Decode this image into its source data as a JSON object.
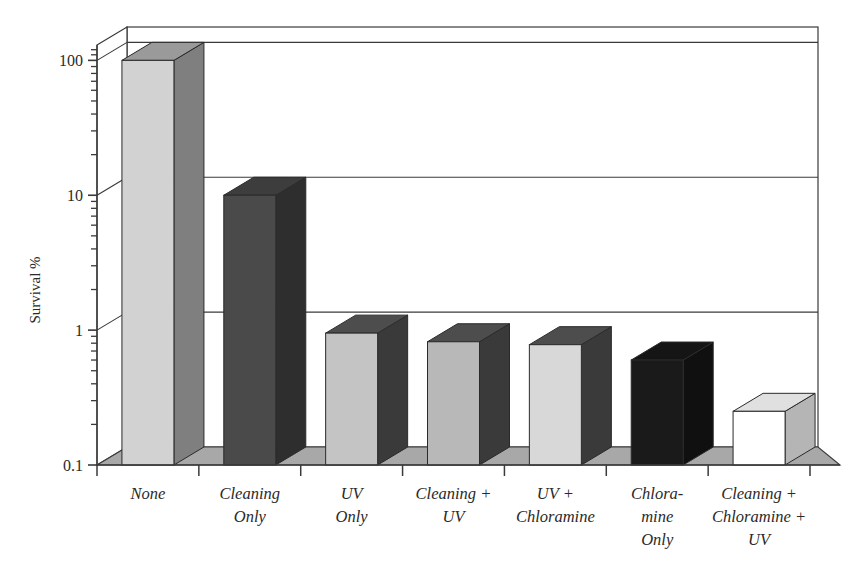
{
  "chart_data": {
    "type": "bar",
    "title": "",
    "subtitle": "",
    "xlabel": "",
    "ylabel": "Survival %",
    "yscale": "log",
    "ylim": [
      0.1,
      130
    ],
    "grid": true,
    "legend": "none",
    "style": "3d-bar",
    "categories": [
      "None",
      "Cleaning Only",
      "UV Only",
      "Cleaning + UV",
      "UV + Chloramine",
      "Chlora-mine Only",
      "Cleaning + Chloramine + UV"
    ],
    "category_lines": [
      [
        "None"
      ],
      [
        "Cleaning",
        "Only"
      ],
      [
        "UV",
        "Only"
      ],
      [
        "Cleaning +",
        "UV"
      ],
      [
        "UV +",
        "Chloramine"
      ],
      [
        "Chlora-",
        "mine",
        "Only"
      ],
      [
        "Cleaning +",
        "Chloramine +",
        "UV"
      ]
    ],
    "values": [
      100,
      10,
      0.95,
      0.82,
      0.78,
      0.6,
      0.25
    ],
    "ytick_labels": [
      "0.1",
      "1",
      "10",
      "100"
    ],
    "ytick_values": [
      0.1,
      1,
      10,
      100
    ],
    "gridline_values": [
      1,
      10,
      100
    ],
    "bar_colors_front": [
      "#d2d2d2",
      "#4a4a4a",
      "#c4c4c4",
      "#b8b8b8",
      "#d8d8d8",
      "#1a1a1a",
      "#ffffff"
    ],
    "bar_colors_side": [
      "#7f7f7f",
      "#2e2e2e",
      "#3a3a3a",
      "#3a3a3a",
      "#3a3a3a",
      "#101010",
      "#b5b5b5"
    ],
    "bar_colors_top": [
      "#9a9a9a",
      "#3d3d3d",
      "#4d4d4d",
      "#4d4d4d",
      "#4d4d4d",
      "#151515",
      "#e0e0e0"
    ],
    "floor_color": "#a8a8a8",
    "axis_color": "#3a3a3a",
    "background_color": "#ffffff"
  }
}
